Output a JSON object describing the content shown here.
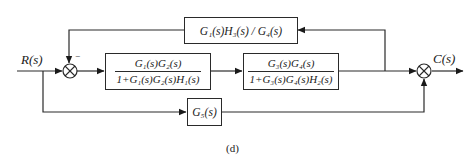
{
  "diagram": {
    "type": "control-system-block-diagram",
    "input_label": "R(s)",
    "output_label": "C(s)",
    "caption": "(d)",
    "line_color": "#2a2a2a",
    "summing_junctions": [
      {
        "id": "sum1",
        "inputs": [
          "R(s)",
          "feedback (-)"
        ],
        "minus_sign": "−"
      },
      {
        "id": "sum2",
        "inputs": [
          "forward path",
          "G5 path"
        ]
      }
    ],
    "blocks": {
      "forward1": {
        "numerator": "G₁(s)G₂(s)",
        "denominator": "1+G₁(s)G₂(s)H₁(s)"
      },
      "forward2": {
        "numerator": "G₃(s)G₄(s)",
        "denominator": "1+G₃(s)G₄(s)H₂(s)"
      },
      "feedback": {
        "label": "G₁(s)H₃(s) / G₄(s)"
      },
      "feedforward": {
        "label": "G₅(s)"
      }
    }
  }
}
